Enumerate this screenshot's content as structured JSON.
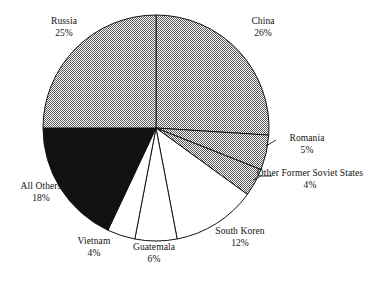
{
  "chart_data": {
    "type": "pie",
    "title": "",
    "subtitle": "",
    "xlabel": "",
    "ylabel": "",
    "legend_position": "none",
    "grid": false,
    "value_unit": "percent",
    "start_angle_deg": 0,
    "direction": "clockwise",
    "categories": [
      "China",
      "Romania",
      "Other Former Soviet States",
      "South Koren",
      "Guatemala",
      "Vietnam",
      "All Others",
      "Russia"
    ],
    "values": [
      26,
      5,
      4,
      12,
      6,
      4,
      18,
      25
    ],
    "slices": [
      {
        "name": "China",
        "label_name": "China",
        "value": 26,
        "percent_text": "26%",
        "fill": "gray-checker",
        "fill_color": "#808080",
        "start_deg": 0,
        "end_deg": 93.6,
        "leader_line": false
      },
      {
        "name": "Romania",
        "label_name": "Romania",
        "value": 5,
        "percent_text": "5%",
        "fill": "gray-checker",
        "fill_color": "#808080",
        "start_deg": 93.6,
        "end_deg": 111.6,
        "leader_line": true
      },
      {
        "name": "Other Former Soviet States",
        "label_name": "Other Former Soviet States",
        "value": 4,
        "percent_text": "4%",
        "fill": "gray-checker",
        "fill_color": "#808080",
        "start_deg": 111.6,
        "end_deg": 126.0,
        "leader_line": true
      },
      {
        "name": "South Koren",
        "label_name": "South Koren",
        "value": 12,
        "percent_text": "12%",
        "fill": "white",
        "fill_color": "#ffffff",
        "start_deg": 126.0,
        "end_deg": 169.2,
        "leader_line": false
      },
      {
        "name": "Guatemala",
        "label_name": "Guatemala",
        "value": 6,
        "percent_text": "6%",
        "fill": "white",
        "fill_color": "#ffffff",
        "start_deg": 169.2,
        "end_deg": 190.8,
        "leader_line": false
      },
      {
        "name": "Vietnam",
        "label_name": "Vietnam",
        "value": 4,
        "percent_text": "4%",
        "fill": "white",
        "fill_color": "#ffffff",
        "start_deg": 190.8,
        "end_deg": 205.2,
        "leader_line": false
      },
      {
        "name": "All Others",
        "label_name": "All Others",
        "value": 18,
        "percent_text": "18%",
        "fill": "black",
        "fill_color": "#111111",
        "start_deg": 205.2,
        "end_deg": 270.0,
        "leader_line": false
      },
      {
        "name": "Russia",
        "label_name": "Russia",
        "value": 25,
        "percent_text": "25%",
        "fill": "gray-checker",
        "fill_color": "#808080",
        "start_deg": 270.0,
        "end_deg": 360.0,
        "leader_line": false
      }
    ]
  },
  "labels": {
    "russia": {
      "name": "Russia",
      "pct": "25%"
    },
    "china": {
      "name": "China",
      "pct": "26%"
    },
    "romania": {
      "name": "Romania",
      "pct": "5%"
    },
    "soviet": {
      "name": "Other Former Soviet States",
      "pct": "4%"
    },
    "south_korea": {
      "name": "South Koren",
      "pct": "12%"
    },
    "guatemala": {
      "name": "Guatemala",
      "pct": "6%"
    },
    "vietnam": {
      "name": "Vietnam",
      "pct": "4%"
    },
    "all_others": {
      "name": "All Others",
      "pct": "18%"
    }
  },
  "colors": {
    "gray": "#808080",
    "black": "#111111",
    "white": "#ffffff",
    "outline": "#141414",
    "background": "#ffffff"
  }
}
